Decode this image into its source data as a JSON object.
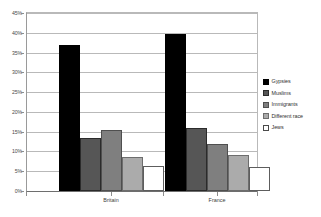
{
  "chart_data": {
    "type": "bar",
    "title": "",
    "subtitle": "",
    "xlabel": "",
    "ylabel": "",
    "categories": [
      "Britain",
      "France"
    ],
    "series": [
      {
        "name": "Gypsies",
        "color": "#000000",
        "values": [
          36.8,
          39.8
        ]
      },
      {
        "name": "Muslims",
        "color": "#565656",
        "values": [
          13.5,
          16.0
        ]
      },
      {
        "name": "Immigrants",
        "color": "#7f7f7f",
        "values": [
          15.4,
          12.0
        ]
      },
      {
        "name": "Different race",
        "color": "#ababab",
        "values": [
          8.6,
          9.0
        ]
      },
      {
        "name": "Jews",
        "color": "#ffffff",
        "values": [
          6.2,
          6.0
        ]
      }
    ],
    "ylim": [
      0,
      45
    ],
    "ytick_values": [
      0,
      5,
      10,
      15,
      20,
      25,
      30,
      35,
      40,
      45
    ],
    "ytick_labels": [
      "0%",
      "5%",
      "10%",
      "15%",
      "20%",
      "25%",
      "30%",
      "35%",
      "40%",
      "45%"
    ],
    "grid": true,
    "grid_axis": "y",
    "legend_position": "right",
    "legend_entries": [
      "Gypsies",
      "Muslims",
      "Immigrants",
      "Different race",
      "Jews"
    ],
    "annotations": []
  },
  "colors": {
    "background": "#ffffff",
    "gridline": "#b9b9b9",
    "axis": "#6e6e6e",
    "tick_text": "#4a4a4a",
    "legend_text": "#2f2f2f"
  }
}
